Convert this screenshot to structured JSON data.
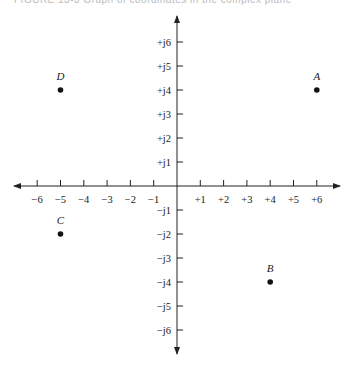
{
  "caption": "FIGURE 13-3 Graph of coordinates in the complex plane",
  "axes": {
    "x_tick_labels": [
      "−6",
      "−5",
      "−4",
      "−3",
      "−2",
      "−1",
      "+1",
      "+2",
      "+3",
      "+4",
      "+5",
      "+6"
    ],
    "x_tick_values": [
      -6,
      -5,
      -4,
      -3,
      -2,
      -1,
      1,
      2,
      3,
      4,
      5,
      6
    ],
    "y_tick_labels": [
      "+j6",
      "+j5",
      "+j4",
      "+j3",
      "+j2",
      "+j1",
      "−j1",
      "−j2",
      "−j3",
      "−j4",
      "−j5",
      "−j6"
    ],
    "y_tick_values": [
      6,
      5,
      4,
      3,
      2,
      1,
      -1,
      -2,
      -3,
      -4,
      -5,
      -6
    ]
  },
  "points": [
    {
      "label": "A",
      "x": 6,
      "y": 4
    },
    {
      "label": "B",
      "x": 4,
      "y": -4
    },
    {
      "label": "C",
      "x": -5,
      "y": -2
    },
    {
      "label": "D",
      "x": -5,
      "y": 4
    }
  ],
  "colors": {
    "axis": "#222222",
    "point": "#111111"
  }
}
